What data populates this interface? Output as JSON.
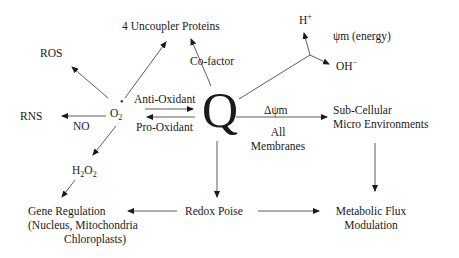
{
  "diagram": {
    "center": {
      "label": "Q"
    },
    "nodes": {
      "uncoupler": "4 Uncoupler Proteins",
      "ros": "ROS",
      "rns": "RNS",
      "o2_main": "O",
      "o2_sub": "2",
      "o2_dot": "•",
      "h_plus": "H",
      "h_plus_sup": "+",
      "oh_minus": "OH",
      "oh_minus_sup": "−",
      "psi_energy": "ψm (energy)",
      "h2o2_h": "H",
      "h2o2_sub1": "2",
      "h2o2_o": "O",
      "h2o2_sub2": "2",
      "subcellular_line1": "Sub-Cellular",
      "subcellular_line2": "Micro Environments",
      "gene_line1": "Gene Regulation",
      "gene_line2": "(Nucleus, Mitochondria",
      "gene_line3": "Chloroplasts)",
      "redox": "Redox Poise",
      "flux_line1": "Metabolic Flux",
      "flux_line2": "Modulation"
    },
    "edge_labels": {
      "cofactor": "Co-factor",
      "antioxidant": "Anti-Oxidant",
      "prooxidant": "Pro-Oxidant",
      "no": "NO",
      "delta_psi": "Δψm",
      "all_membranes_1": "All",
      "all_membranes_2": "Membranes"
    }
  }
}
